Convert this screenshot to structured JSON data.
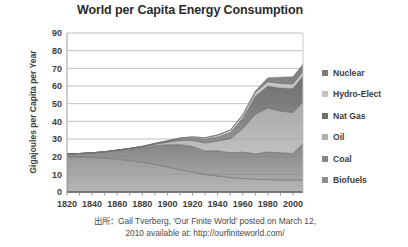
{
  "chart_data": {
    "type": "area",
    "stacked": true,
    "title": "World per Capita Energy Consumption",
    "xlabel": "",
    "ylabel": "Gigajoules per Capita per Year",
    "ylim": [
      0,
      90
    ],
    "ytick_step": 10,
    "yticks": [
      "0",
      "10",
      "20",
      "30",
      "40",
      "50",
      "60",
      "70",
      "80",
      "90"
    ],
    "xlim": [
      1820,
      2008
    ],
    "xticks": [
      "1820",
      "1840",
      "1860",
      "1880",
      "1900",
      "1920",
      "1940",
      "1960",
      "1980",
      "2000"
    ],
    "xtick_step": 20,
    "minor_xtick_step": 10,
    "grid": "horizontal",
    "legend_position": "right",
    "x": [
      1820,
      1830,
      1840,
      1850,
      1860,
      1870,
      1880,
      1890,
      1900,
      1910,
      1920,
      1930,
      1940,
      1950,
      1960,
      1970,
      1980,
      1990,
      2000,
      2008
    ],
    "series": [
      {
        "name": "Biofuels",
        "color": "#9a9a9a",
        "values": [
          20.0,
          19.8,
          19.6,
          19.2,
          18.6,
          17.8,
          16.8,
          15.6,
          14.2,
          12.6,
          11.2,
          10.0,
          9.0,
          8.2,
          7.6,
          7.2,
          7.0,
          6.8,
          6.8,
          6.8
        ]
      },
      {
        "name": "Coal",
        "color": "#858585",
        "values": [
          1.6,
          2.0,
          2.6,
          3.6,
          5.0,
          6.6,
          8.4,
          10.6,
          12.6,
          14.2,
          14.6,
          13.2,
          14.4,
          14.0,
          15.0,
          14.4,
          15.6,
          15.4,
          15.0,
          20.6
        ]
      },
      {
        "name": "Oil",
        "color": "#a8a8a8",
        "values": [
          0.0,
          0.0,
          0.0,
          0.0,
          0.1,
          0.2,
          0.4,
          0.8,
          1.4,
          2.4,
          3.4,
          4.6,
          5.4,
          8.0,
          13.2,
          22.4,
          25.0,
          23.6,
          23.2,
          23.6
        ]
      },
      {
        "name": "Nat Gas",
        "color": "#6f6f6f",
        "values": [
          0.0,
          0.0,
          0.0,
          0.0,
          0.0,
          0.1,
          0.2,
          0.4,
          0.6,
          1.0,
          1.4,
          2.0,
          2.4,
          3.4,
          6.0,
          10.2,
          12.4,
          13.0,
          13.6,
          14.6
        ]
      },
      {
        "name": "Hydro-Elect",
        "color": "#c4c4c4",
        "values": [
          0.0,
          0.0,
          0.0,
          0.0,
          0.0,
          0.0,
          0.0,
          0.1,
          0.2,
          0.4,
          0.6,
          0.9,
          1.1,
          1.4,
          1.8,
          2.2,
          2.4,
          2.6,
          2.6,
          2.8
        ]
      },
      {
        "name": "Nuclear",
        "color": "#7d7d7d",
        "values": [
          0.0,
          0.0,
          0.0,
          0.0,
          0.0,
          0.0,
          0.0,
          0.0,
          0.0,
          0.0,
          0.0,
          0.0,
          0.0,
          0.0,
          0.2,
          0.8,
          2.2,
          3.6,
          4.0,
          4.0
        ]
      }
    ],
    "legend": [
      {
        "label": "Nuclear",
        "color": "#7d7d7d"
      },
      {
        "label": "Hydro-Elect",
        "color": "#c4c4c4"
      },
      {
        "label": "Nat Gas",
        "color": "#6f6f6f"
      },
      {
        "label": "Oil",
        "color": "#b0b0b0"
      },
      {
        "label": "Coal",
        "color": "#858585"
      },
      {
        "label": "Biofuels",
        "color": "#8f8f8f"
      }
    ]
  },
  "caption": {
    "line1": "出所：Gail Tverberg, 'Our Finite World' posted on March 12,",
    "line2": "2010 available at: http://ourfiniteworld.com/"
  }
}
